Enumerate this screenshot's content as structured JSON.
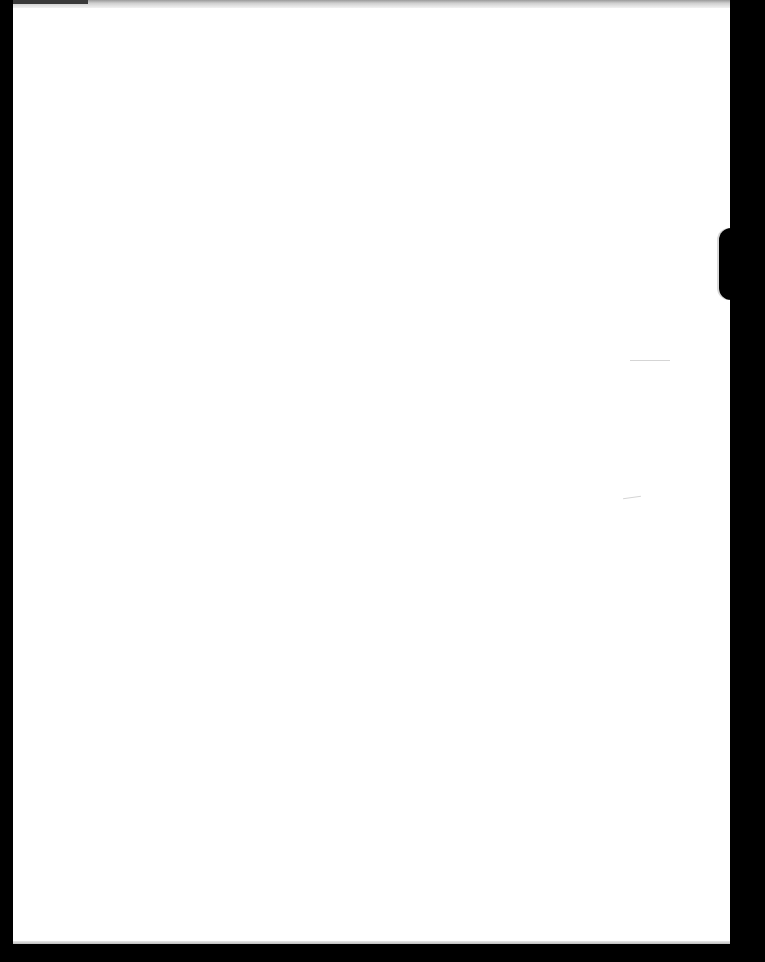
{
  "document": {
    "type": "blank scanned page",
    "text_content": "",
    "page_color": "#ffffff",
    "background_color": "#000000"
  },
  "layout": {
    "page": {
      "left": 13,
      "top": 0,
      "width": 717,
      "height": 944
    },
    "notch": {
      "top": 228,
      "height": 72
    }
  }
}
